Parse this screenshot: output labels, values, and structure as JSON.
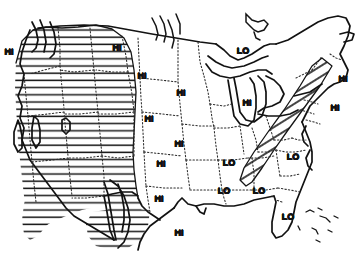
{
  "map": {
    "title": "United States outline map with HI and LO region markings",
    "background_color": "#ffffff",
    "ink_color": "#121212",
    "width": 364,
    "height": 254,
    "legend_note": "",
    "hatch_regions": [
      {
        "name": "western-cordillera-hatch",
        "label": "Western mountain region",
        "pattern": "horizontal-lines",
        "marking": "HI"
      },
      {
        "name": "appalachian-hatch",
        "label": "Appalachian region",
        "pattern": "diagonal-lines",
        "marking": "HI"
      }
    ],
    "border_styles": {
      "coastline": "solid",
      "state": "dotted"
    },
    "labels": [
      {
        "id": "hi-pacific-northwest",
        "text": "HI",
        "x": 9,
        "y": 52
      },
      {
        "id": "hi-northern-plains",
        "text": "HI",
        "x": 117,
        "y": 48
      },
      {
        "id": "hi-north-dakota",
        "text": "HI",
        "x": 142,
        "y": 76
      },
      {
        "id": "hi-minnesota",
        "text": "HI",
        "x": 181,
        "y": 93
      },
      {
        "id": "hi-nebraska",
        "text": "HI",
        "x": 149,
        "y": 119
      },
      {
        "id": "hi-iowa",
        "text": "HI",
        "x": 179,
        "y": 144
      },
      {
        "id": "hi-kansas",
        "text": "HI",
        "x": 161,
        "y": 164
      },
      {
        "id": "hi-oklahoma",
        "text": "HI",
        "x": 159,
        "y": 199
      },
      {
        "id": "hi-texas",
        "text": "HI",
        "x": 179,
        "y": 233
      },
      {
        "id": "lo-great-lakes",
        "text": "LO",
        "x": 243,
        "y": 51
      },
      {
        "id": "hi-michigan",
        "text": "HI",
        "x": 247,
        "y": 103
      },
      {
        "id": "hi-new-england",
        "text": "HI",
        "x": 343,
        "y": 79
      },
      {
        "id": "hi-mid-atlantic",
        "text": "HI",
        "x": 335,
        "y": 108
      },
      {
        "id": "lo-tennessee",
        "text": "LO",
        "x": 229,
        "y": 163
      },
      {
        "id": "lo-carolinas",
        "text": "LO",
        "x": 293,
        "y": 157
      },
      {
        "id": "lo-mississippi",
        "text": "LO",
        "x": 224,
        "y": 191
      },
      {
        "id": "lo-alabama",
        "text": "LO",
        "x": 259,
        "y": 191
      },
      {
        "id": "lo-florida",
        "text": "LO",
        "x": 288,
        "y": 217
      }
    ]
  }
}
